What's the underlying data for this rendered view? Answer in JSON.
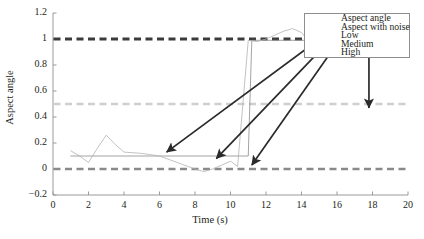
{
  "chart_data": {
    "type": "line",
    "title": "",
    "xlabel": "Time (s)",
    "ylabel": "Aspect angle",
    "xlim": [
      0,
      20
    ],
    "ylim": [
      -0.2,
      1.2
    ],
    "xticks": [
      "0",
      "2",
      "4",
      "6",
      "8",
      "10",
      "12",
      "14",
      "16",
      "18",
      "20"
    ],
    "yticks": [
      "1.2",
      "1",
      "0.8",
      "0.6",
      "0.4",
      "0.2",
      "0",
      "−0.2"
    ],
    "grid": false,
    "legend_position": "upper right",
    "series": [
      {
        "name": "Aspect angle",
        "style": "solid",
        "color": "#8c8c8c",
        "width": 0.8,
        "x": [
          1,
          10,
          10.2,
          11,
          11.2,
          14.3,
          20
        ],
        "y": [
          0.1,
          0.1,
          0.1,
          0.1,
          0.99,
          0.99,
          0.99
        ]
      },
      {
        "name": "Aspect with noise",
        "style": "solid",
        "color": "#b3b3b3",
        "width": 0.8,
        "x": [
          1,
          1.5,
          2,
          2.5,
          3,
          3.5,
          4,
          5,
          6,
          7,
          8,
          8.5,
          9,
          9.5,
          10,
          10.4,
          11,
          11.5,
          12,
          12.5,
          13,
          13.5,
          14,
          14.3,
          15,
          16,
          17,
          18,
          19,
          20
        ],
        "y": [
          0.14,
          0.1,
          0.05,
          0.16,
          0.26,
          0.19,
          0.13,
          0.12,
          0.1,
          0.05,
          0.0,
          -0.02,
          0.0,
          0.03,
          0.06,
          0.02,
          0.99,
          0.98,
          1.0,
          1.03,
          1.06,
          1.08,
          1.05,
          1.0,
          1.0,
          1.0,
          1.0,
          1.0,
          1.0,
          1.0
        ]
      },
      {
        "name": "Low",
        "style": "dashed",
        "color": "#8a8a8a",
        "width": 2.4,
        "constant": 0
      },
      {
        "name": "Medium",
        "style": "dashed",
        "color": "#cfcfcf",
        "width": 2.4,
        "constant": 0.5
      },
      {
        "name": "High",
        "style": "dashed",
        "color": "#3b3b3b",
        "width": 2.8,
        "constant": 1.0
      }
    ],
    "annotations": [
      {
        "kind": "arrow",
        "from": [
          16.6,
          1.16
        ],
        "to": [
          6.4,
          0.13
        ]
      },
      {
        "kind": "arrow",
        "from": [
          16.8,
          1.16
        ],
        "to": [
          9.2,
          0.08
        ]
      },
      {
        "kind": "arrow",
        "from": [
          17.0,
          1.16
        ],
        "to": [
          11.2,
          0.03
        ]
      },
      {
        "kind": "arrow",
        "from": [
          17.8,
          0.97
        ],
        "to": [
          17.8,
          0.47
        ]
      }
    ]
  },
  "legend": {
    "items": [
      {
        "label": "Aspect angle"
      },
      {
        "label": "Aspect with noise"
      },
      {
        "label": "Low"
      },
      {
        "label": "Medium"
      },
      {
        "label": "High"
      }
    ]
  },
  "colors": {
    "axis": "#8e8e8e",
    "text": "#231f20",
    "arrow": "#2b2b2b",
    "background": "#ffffff"
  }
}
